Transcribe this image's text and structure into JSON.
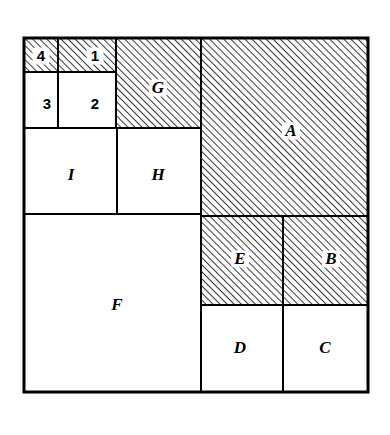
{
  "figure": {
    "background_color": "#ffffff",
    "line_color": "#000000",
    "hatch_color": "#000000",
    "fill_color": "#ffffff",
    "outer_border_width": 3,
    "inner_border_width": 2,
    "bounds": {
      "x": 24,
      "y": 38,
      "width": 344,
      "height": 354
    },
    "hatch": {
      "angle_degrees": 45,
      "spacing_px": 5,
      "stroke_width": 1.6
    }
  },
  "chart_data": {
    "type": "diagram",
    "xlabel": "",
    "ylabel": "",
    "grid": false,
    "legend": "none",
    "outer_square": {
      "x": 24,
      "y": 38,
      "width": 344,
      "height": 354
    },
    "vertical_gridlines": [
      24,
      58,
      116,
      201,
      283,
      368
    ],
    "horizontal_gridlines": [
      38,
      72,
      128,
      214,
      216,
      305,
      392
    ],
    "regions": [
      {
        "label": "4",
        "hatched": true,
        "x": 24,
        "y": 38,
        "width": 34,
        "height": 34,
        "label_x": 41,
        "label_y": 56
      },
      {
        "label": "1",
        "hatched": true,
        "x": 58,
        "y": 38,
        "width": 58,
        "height": 34,
        "label_x": 95,
        "label_y": 56
      },
      {
        "label": "G",
        "hatched": true,
        "x": 116,
        "y": 38,
        "width": 85,
        "height": 90,
        "label_x": 158,
        "label_y": 88
      },
      {
        "label": "A",
        "hatched": true,
        "x": 201,
        "y": 38,
        "width": 167,
        "height": 178,
        "label_x": 291,
        "label_y": 131
      },
      {
        "label": "3",
        "hatched": false,
        "x": 24,
        "y": 72,
        "width": 34,
        "height": 56,
        "label_x": 47,
        "label_y": 104
      },
      {
        "label": "2",
        "hatched": false,
        "x": 58,
        "y": 72,
        "width": 58,
        "height": 56,
        "label_x": 95,
        "label_y": 104
      },
      {
        "label": "I",
        "hatched": false,
        "x": 24,
        "y": 128,
        "width": 93,
        "height": 86,
        "label_x": 71,
        "label_y": 175
      },
      {
        "label": "H",
        "hatched": false,
        "x": 117,
        "y": 128,
        "width": 84,
        "height": 86,
        "label_x": 158,
        "label_y": 175
      },
      {
        "label": "F",
        "hatched": false,
        "x": 24,
        "y": 214,
        "width": 177,
        "height": 178,
        "label_x": 117,
        "label_y": 305
      },
      {
        "label": "E",
        "hatched": true,
        "x": 201,
        "y": 216,
        "width": 82,
        "height": 89,
        "label_x": 240,
        "label_y": 259
      },
      {
        "label": "B",
        "hatched": true,
        "x": 283,
        "y": 216,
        "width": 85,
        "height": 89,
        "label_x": 331,
        "label_y": 259
      },
      {
        "label": "D",
        "hatched": false,
        "x": 201,
        "y": 305,
        "width": 82,
        "height": 87,
        "label_x": 240,
        "label_y": 348
      },
      {
        "label": "C",
        "hatched": false,
        "x": 283,
        "y": 305,
        "width": 85,
        "height": 87,
        "label_x": 325,
        "label_y": 348
      }
    ],
    "numeral_labels": [
      "1",
      "2",
      "3",
      "4"
    ],
    "letter_labels": [
      "A",
      "B",
      "C",
      "D",
      "E",
      "F",
      "G",
      "H",
      "I"
    ],
    "hatched_labels": [
      "4",
      "1",
      "G",
      "A",
      "E",
      "B"
    ],
    "plain_labels": [
      "3",
      "2",
      "I",
      "H",
      "F",
      "D",
      "C"
    ]
  }
}
